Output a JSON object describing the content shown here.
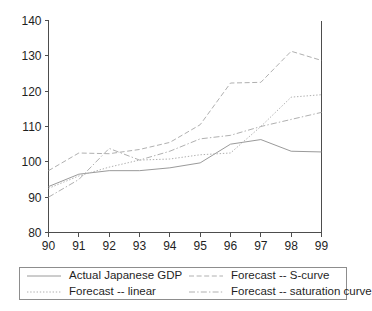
{
  "chart_data": {
    "type": "line",
    "title": "",
    "xlabel": "",
    "ylabel": "",
    "x": [
      "90",
      "91",
      "92",
      "93",
      "94",
      "95",
      "96",
      "97",
      "98",
      "99"
    ],
    "xlim": [
      90,
      99
    ],
    "ylim": [
      80,
      140
    ],
    "yticks": [
      80,
      90,
      100,
      110,
      120,
      130,
      140
    ],
    "xticks": [
      "90",
      "91",
      "92",
      "93",
      "94",
      "95",
      "96",
      "97",
      "98",
      "99"
    ],
    "grid": false,
    "legend_position": "below",
    "series": [
      {
        "name": "Actual Japanese GDP",
        "style": "solid",
        "color": "#9a9a9a",
        "values": [
          93.0,
          96.5,
          97.5,
          97.5,
          98.3,
          99.7,
          105.0,
          106.3,
          103.0,
          102.8
        ]
      },
      {
        "name": "Forecast -- S-curve",
        "style": "dashed",
        "color": "#b0b0b0",
        "values": [
          97.5,
          102.5,
          102.3,
          103.5,
          105.5,
          110.5,
          122.3,
          122.5,
          131.3,
          128.7
        ]
      },
      {
        "name": "Forecast -- linear",
        "style": "dotted",
        "color": "#b0b0b0",
        "values": [
          92.5,
          96.0,
          98.5,
          100.5,
          100.8,
          102.0,
          102.5,
          110.0,
          118.3,
          119.0
        ]
      },
      {
        "name": "Forecast -- saturation curve",
        "style": "dashdot",
        "color": "#b0b0b0",
        "values": [
          90.0,
          95.0,
          103.8,
          100.5,
          103.0,
          106.5,
          107.5,
          110.0,
          112.0,
          114.0
        ]
      }
    ]
  },
  "legend": {
    "entries": [
      {
        "label": "Actual Japanese GDP",
        "style": "solid"
      },
      {
        "label": "Forecast -- S-curve",
        "style": "dashed"
      },
      {
        "label": "Forecast -- linear",
        "style": "dotted"
      },
      {
        "label": "Forecast -- saturation curve",
        "style": "dashdot"
      }
    ]
  }
}
